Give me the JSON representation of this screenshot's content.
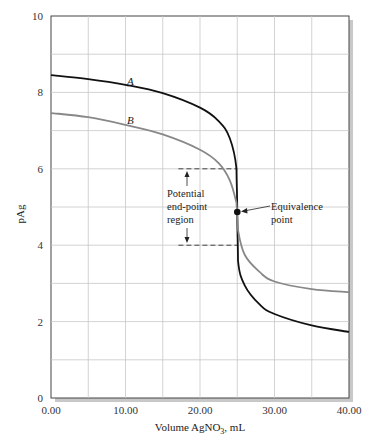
{
  "chart_data": {
    "type": "line",
    "title": "",
    "xlabel": "Volume AgNO3, mL",
    "xlabel_main": "Volume AgNO",
    "xlabel_sub": "3",
    "xlabel_tail": ", mL",
    "ylabel": "pAg",
    "xlim": [
      0,
      40
    ],
    "ylim": [
      0,
      10
    ],
    "grid": true,
    "x_ticks": [
      "0.00",
      "10.00",
      "20.00",
      "30.00",
      "40.00"
    ],
    "y_ticks": [
      "0",
      "2",
      "4",
      "6",
      "8",
      "10"
    ],
    "series": [
      {
        "name": "A",
        "color": "#111111",
        "x": [
          0,
          5,
          10,
          15,
          20,
          22.5,
          24,
          24.9,
          25,
          25.1,
          26,
          28,
          30,
          35,
          40
        ],
        "y": [
          8.45,
          8.35,
          8.2,
          7.98,
          7.6,
          7.25,
          6.8,
          6.0,
          4.87,
          3.6,
          2.95,
          2.45,
          2.2,
          1.9,
          1.73
        ]
      },
      {
        "name": "B",
        "color": "#888888",
        "x": [
          0,
          5,
          10,
          15,
          20,
          22.5,
          24,
          24.9,
          25,
          25.1,
          26,
          28,
          30,
          35,
          40
        ],
        "y": [
          7.46,
          7.35,
          7.15,
          6.9,
          6.5,
          6.15,
          5.7,
          5.1,
          4.87,
          4.4,
          3.75,
          3.3,
          3.05,
          2.85,
          2.77
        ]
      }
    ],
    "annotations": [
      {
        "text": "Equivalence point",
        "lines": [
          "Equivalence",
          "point"
        ],
        "x": 25.0,
        "y": 4.87
      },
      {
        "text": "Potential end-point region",
        "lines": [
          "Potential",
          "end-point",
          "region"
        ],
        "y_range": [
          4,
          6
        ]
      }
    ]
  }
}
